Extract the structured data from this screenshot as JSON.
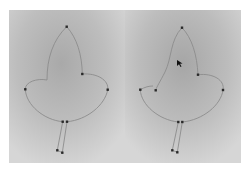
{
  "figure": {
    "panels": [
      {
        "name": "before",
        "background": {
          "light": "#d2d2d2",
          "dark": "#a9a9a9"
        },
        "path_color": "#8c8c8c",
        "anchor_color": "#2a2a2a",
        "anchors": [
          [
            57.7,
            16.7
          ],
          [
            73.3,
            64
          ],
          [
            16.3,
            79.3
          ],
          [
            98.7,
            79.7
          ],
          [
            53.7,
            111.7
          ],
          [
            58,
            111.7
          ],
          [
            48.3,
            140.3
          ],
          [
            53.3,
            142.7
          ]
        ]
      },
      {
        "name": "after",
        "background": {
          "light": "#d4d4d4",
          "dark": "#a6a6a6"
        },
        "path_color": "#8c8c8c",
        "anchor_color": "#2a2a2a",
        "anchors": [
          [
            57,
            17.7
          ],
          [
            73,
            64.7
          ],
          [
            15.3,
            79.7
          ],
          [
            30.7,
            80.3
          ],
          [
            98,
            80
          ],
          [
            53.3,
            112
          ],
          [
            57.3,
            112
          ],
          [
            47.3,
            140.3
          ],
          [
            52.3,
            142.3
          ]
        ],
        "cursor": [
          52.3,
          52
        ]
      }
    ]
  }
}
